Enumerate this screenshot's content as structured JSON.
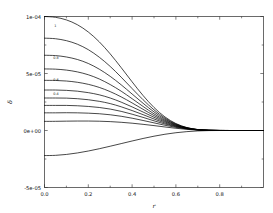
{
  "chart_data": {
    "type": "line",
    "title": "",
    "subtitle": "",
    "xlabel": "r",
    "ylabel": "δ",
    "xlim": [
      0.0,
      1.0
    ],
    "ylim": [
      -5e-05,
      0.0001
    ],
    "grid": false,
    "legend": "none",
    "xticks": [
      0.0,
      0.2,
      0.4,
      0.6,
      0.8
    ],
    "xtick_labels": [
      "0.0",
      "0.2",
      "0.4",
      "0.6",
      "0.8"
    ],
    "yticks": [
      -5e-05,
      0.0,
      5e-05,
      0.0001
    ],
    "ytick_labels": [
      "-5e-05",
      "0e+00",
      "5e-05",
      "1e-04"
    ],
    "x": [
      0.0,
      0.05,
      0.1,
      0.15,
      0.2,
      0.25,
      0.3,
      0.35,
      0.4,
      0.45,
      0.5,
      0.55,
      0.6,
      0.65,
      0.7,
      0.75,
      0.8,
      0.85,
      0.9,
      0.95,
      1.0
    ],
    "annotations": [
      {
        "text": "1",
        "x": 0.045,
        "y": 9.1e-05
      },
      {
        "text": "0.8",
        "x": 0.04,
        "y": 6.3e-05
      },
      {
        "text": "0.6",
        "x": 0.04,
        "y": 4.3e-05
      },
      {
        "text": "0.4",
        "x": 0.04,
        "y": 3.1e-05
      }
    ],
    "series": [
      {
        "name": "1.0",
        "values": [
          0.0001,
          9.93e-05,
          9.7e-05,
          9.28e-05,
          8.64e-05,
          7.78e-05,
          6.72e-05,
          5.52e-05,
          4.27e-05,
          3.07e-05,
          2.02e-05,
          1.19e-05,
          6.1e-06,
          2.6e-06,
          8.5e-07,
          1.8e-07,
          2e-08,
          0.0,
          0.0,
          0.0,
          0.0
        ]
      },
      {
        "name": "0.9",
        "values": [
          8.1e-05,
          8.05e-05,
          7.88e-05,
          7.57e-05,
          7.09e-05,
          6.43e-05,
          5.62e-05,
          4.68e-05,
          3.68e-05,
          2.7e-05,
          1.81e-05,
          1.09e-05,
          5.7e-06,
          2.45e-06,
          8e-07,
          1.7e-07,
          2e-08,
          0.0,
          0.0,
          0.0,
          0.0
        ]
      },
      {
        "name": "0.8",
        "values": [
          6.6e-05,
          6.57e-05,
          6.45e-05,
          6.23e-05,
          5.88e-05,
          5.38e-05,
          4.75e-05,
          4.01e-05,
          3.2e-05,
          2.39e-05,
          1.63e-05,
          1e-05,
          5.3e-06,
          2.3e-06,
          7.6e-07,
          1.6e-07,
          2e-08,
          0.0,
          0.0,
          0.0,
          0.0
        ]
      },
      {
        "name": "0.7",
        "values": [
          5.4e-05,
          5.38e-05,
          5.3e-05,
          5.14e-05,
          4.89e-05,
          4.52e-05,
          4.03e-05,
          3.45e-05,
          2.79e-05,
          2.11e-05,
          1.46e-05,
          9.1e-06,
          4.9e-06,
          2.15e-06,
          7.2e-07,
          1.5e-07,
          2e-08,
          0.0,
          0.0,
          0.0,
          0.0
        ]
      },
      {
        "name": "0.6",
        "values": [
          4.4e-05,
          4.39e-05,
          4.34e-05,
          4.23e-05,
          4.05e-05,
          3.78e-05,
          3.41e-05,
          2.95e-05,
          2.42e-05,
          1.86e-05,
          1.31e-05,
          8.3e-06,
          4.5e-06,
          2e-06,
          6.8e-07,
          1.4e-07,
          2e-08,
          0.0,
          0.0,
          0.0,
          0.0
        ]
      },
      {
        "name": "0.5",
        "values": [
          3.55e-05,
          3.55e-05,
          3.52e-05,
          3.45e-05,
          3.32e-05,
          3.13e-05,
          2.85e-05,
          2.49e-05,
          2.07e-05,
          1.62e-05,
          1.16e-05,
          7.5e-06,
          4.1e-06,
          1.85e-06,
          6.4e-07,
          1.3e-07,
          2e-08,
          0.0,
          0.0,
          0.0,
          0.0
        ]
      },
      {
        "name": "0.4",
        "values": [
          2.85e-05,
          2.85e-05,
          2.84e-05,
          2.79e-05,
          2.7e-05,
          2.56e-05,
          2.36e-05,
          2.08e-05,
          1.75e-05,
          1.39e-05,
          1.01e-05,
          6.6e-06,
          3.7e-06,
          1.7e-06,
          6e-07,
          1.2e-07,
          2e-08,
          0.0,
          0.0,
          0.0,
          0.0
        ]
      },
      {
        "name": "0.3",
        "values": [
          2.2e-05,
          2.2e-05,
          2.2e-05,
          2.17e-05,
          2.11e-05,
          2.02e-05,
          1.88e-05,
          1.68e-05,
          1.43e-05,
          1.15e-05,
          8.5e-06,
          5.7e-06,
          3.3e-06,
          1.55e-06,
          5.6e-07,
          1.1e-07,
          2e-08,
          0.0,
          0.0,
          0.0,
          0.0
        ]
      },
      {
        "name": "0.2",
        "values": [
          1.55e-05,
          1.55e-05,
          1.56e-05,
          1.55e-05,
          1.52e-05,
          1.47e-05,
          1.38e-05,
          1.25e-05,
          1.08e-05,
          8.8e-06,
          6.7e-06,
          4.6e-06,
          2.75e-06,
          1.35e-06,
          5e-07,
          1e-07,
          2e-08,
          0.0,
          0.0,
          0.0,
          0.0
        ]
      },
      {
        "name": "0.1",
        "values": [
          8e-06,
          8.05e-06,
          8.2e-06,
          8.3e-06,
          8.3e-06,
          8.15e-06,
          7.8e-06,
          7.2e-06,
          6.4e-06,
          5.4e-06,
          4.3e-06,
          3.1e-06,
          1.95e-06,
          1e-06,
          3.8e-07,
          8e-08,
          1e-08,
          0.0,
          0.0,
          0.0,
          0.0
        ]
      },
      {
        "name": "0.0",
        "values": [
          -2.2e-05,
          -2.18e-05,
          -2.1e-05,
          -1.97e-05,
          -1.8e-05,
          -1.6e-05,
          -1.38e-05,
          -1.15e-05,
          -9.2e-06,
          -7e-06,
          -5e-06,
          -3.3e-06,
          -1.95e-06,
          -1e-06,
          -3.8e-07,
          -8e-08,
          -1e-08,
          0.0,
          0.0,
          0.0,
          0.0
        ]
      }
    ]
  }
}
